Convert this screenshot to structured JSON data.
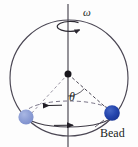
{
  "figure": {
    "kind": "physics-diagram",
    "width": 138,
    "height": 147,
    "background_color": "#fdfdfd"
  },
  "labels": {
    "omega": "ω",
    "theta": "θ",
    "bead": "Bead"
  },
  "colors": {
    "stroke": "#3b3742",
    "hoop": "#4a4653",
    "axis": "#3f3b46",
    "dashed": "#6d6878",
    "bead_solid": "#2244a8",
    "bead_faded": "#8fa0d8",
    "pivot": "#18161c",
    "text": "#201d22"
  },
  "geometry": {
    "hoop": {
      "cx": 69,
      "cy": 78,
      "rx": 59,
      "ry": 58
    },
    "spin_ellipse": {
      "cx": 69,
      "cy": 26,
      "rx": 13,
      "ry": 5
    },
    "orbit_ellipse": {
      "cx": 69,
      "cy": 114,
      "rx": 44,
      "ry": 13
    },
    "pivot": {
      "x": 68,
      "y": 74,
      "r": 3.4
    },
    "axis": {
      "x": 68,
      "y1": 4,
      "y2": 147
    },
    "bead_solid": {
      "cx": 112,
      "cy": 113,
      "r": 7.5
    },
    "bead_faded": {
      "cx": 26,
      "cy": 117,
      "r": 7.5
    },
    "radius_line": {
      "x1": 68,
      "y1": 74,
      "x2": 109,
      "y2": 110
    },
    "angle_arc_radius": 22
  },
  "annotations": {
    "omega_position": {
      "x": 83,
      "y": 15
    },
    "theta_position": {
      "x": 69,
      "y": 99
    },
    "bead_label_position": {
      "x": 100,
      "y": 136
    },
    "spin_direction": "counter-clockwise-about-vertical-axis",
    "orbit_top_arrow": "left",
    "orbit_bottom_arrow": "right"
  }
}
